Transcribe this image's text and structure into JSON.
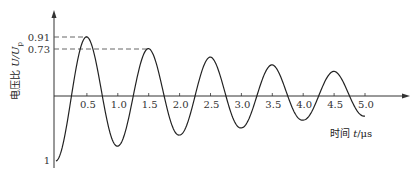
{
  "chart_data": {
    "type": "line",
    "title": "",
    "xlabel": "时间 t/μs",
    "ylabel": "电压比 U/U_p",
    "xlim": [
      0,
      5.0
    ],
    "ylim": [
      -1,
      1
    ],
    "grid": false,
    "legend": null,
    "x_ticks": [
      "0.5",
      "1.0",
      "1.5",
      "2.0",
      "2.5",
      "3.0",
      "3.5",
      "4.0",
      "4.5",
      "5.0"
    ],
    "y_ticks": [
      "0.91",
      "0.73",
      "1"
    ],
    "annotations": [
      {
        "type": "dashed-reference",
        "y": 0.91,
        "x_end": 0.5
      },
      {
        "type": "dashed-reference",
        "y": 0.73,
        "x_end": 1.5
      }
    ],
    "series": [
      {
        "name": "U/Up",
        "x": [
          0,
          0.5,
          1.0,
          1.5,
          2.0,
          2.5,
          3.0,
          3.5,
          4.0,
          4.5,
          5.0
        ],
        "values": [
          -1.0,
          0.91,
          -0.77,
          0.73,
          -0.6,
          0.6,
          -0.49,
          0.48,
          -0.37,
          0.38,
          -0.31
        ]
      }
    ]
  },
  "labels": {
    "y_axis_title_main": "电压比 ",
    "y_axis_title_var": "U/U",
    "y_axis_title_sub": "p",
    "x_axis_title_main": "时间 ",
    "x_axis_title_var": "t",
    "x_axis_title_unit": "/μs",
    "y_tick_091": "0.91",
    "y_tick_073": "0.73",
    "y_tick_neg1": "1"
  }
}
